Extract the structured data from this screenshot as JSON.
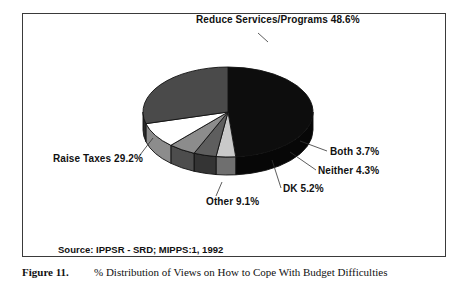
{
  "figure": {
    "number_label": "Figure 11.",
    "caption": "% Distribution of Views on How to Cope With Budget Difficulties",
    "source_note": "Source: IPPSR - SRD; MIPPS:1, 1992"
  },
  "labels": {
    "reduce": "Reduce Services/Programs 48.6%",
    "raise": "Raise Taxes  29.2%",
    "other": "Other  9.1%",
    "dk": "DK  5.2%",
    "neither": "Neither  4.3%",
    "both": "Both  3.7%"
  },
  "colors": {
    "reduce": "#0d0d0d",
    "raise": "#4a4a4a",
    "other": "#ffffff",
    "dk": "#8c8c8c",
    "neither": "#5e5e5e",
    "both": "#c9c9c9",
    "outline": "#111111",
    "frame": "#3a3a3a",
    "background": "#ffffff"
  },
  "chart_data": {
    "type": "pie",
    "title": "% Distribution of Views on How to Cope With Budget Difficulties",
    "subtitle": "",
    "source": "Source: IPPSR - SRD; MIPPS:1, 1992",
    "unit": "percent",
    "three_d": true,
    "legend_position": "callout-labels",
    "categories": [
      "Reduce Services/Programs",
      "Both",
      "Neither",
      "DK",
      "Other",
      "Raise Taxes"
    ],
    "values": [
      48.6,
      3.7,
      4.3,
      5.2,
      9.1,
      29.2
    ],
    "slices": [
      {
        "label": "Reduce Services/Programs",
        "value": 48.6,
        "display": "48.6%",
        "color": "#0d0d0d"
      },
      {
        "label": "Both",
        "value": 3.7,
        "display": "3.7%",
        "color": "#c9c9c9"
      },
      {
        "label": "Neither",
        "value": 4.3,
        "display": "4.3%",
        "color": "#5e5e5e"
      },
      {
        "label": "DK",
        "value": 5.2,
        "display": "5.2%",
        "color": "#8c8c8c"
      },
      {
        "label": "Other",
        "value": 9.1,
        "display": "9.1%",
        "color": "#ffffff"
      },
      {
        "label": "Raise Taxes",
        "value": 29.2,
        "display": "29.2%",
        "color": "#4a4a4a"
      }
    ],
    "total": 100.1
  }
}
